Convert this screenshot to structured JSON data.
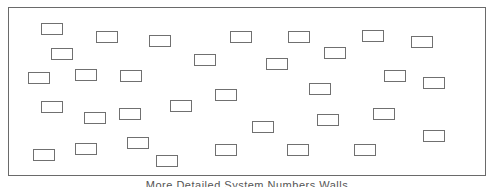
{
  "diagram": {
    "frame": {
      "x": 8,
      "y": 7,
      "width": 478,
      "height": 169,
      "stroke": "#6a6a6a"
    },
    "box_style": {
      "width": 22,
      "height": 12,
      "stroke": "#707070",
      "fill": "#ffffff"
    },
    "boxes": [
      {
        "x": 41,
        "y": 23
      },
      {
        "x": 96,
        "y": 31
      },
      {
        "x": 149,
        "y": 35
      },
      {
        "x": 51,
        "y": 48
      },
      {
        "x": 28,
        "y": 72
      },
      {
        "x": 75,
        "y": 69
      },
      {
        "x": 120,
        "y": 70
      },
      {
        "x": 230,
        "y": 31
      },
      {
        "x": 288,
        "y": 31
      },
      {
        "x": 194,
        "y": 54
      },
      {
        "x": 266,
        "y": 58
      },
      {
        "x": 362,
        "y": 30
      },
      {
        "x": 411,
        "y": 36
      },
      {
        "x": 324,
        "y": 47
      },
      {
        "x": 384,
        "y": 70
      },
      {
        "x": 423,
        "y": 77
      },
      {
        "x": 309,
        "y": 83
      },
      {
        "x": 41,
        "y": 101
      },
      {
        "x": 84,
        "y": 112
      },
      {
        "x": 119,
        "y": 108
      },
      {
        "x": 170,
        "y": 100
      },
      {
        "x": 215,
        "y": 89
      },
      {
        "x": 33,
        "y": 149
      },
      {
        "x": 75,
        "y": 143
      },
      {
        "x": 127,
        "y": 137
      },
      {
        "x": 156,
        "y": 155
      },
      {
        "x": 215,
        "y": 144
      },
      {
        "x": 252,
        "y": 121
      },
      {
        "x": 317,
        "y": 114
      },
      {
        "x": 373,
        "y": 108
      },
      {
        "x": 287,
        "y": 144
      },
      {
        "x": 354,
        "y": 144
      },
      {
        "x": 423,
        "y": 130
      }
    ],
    "caption": "More Detailed System Numbers Walls"
  }
}
